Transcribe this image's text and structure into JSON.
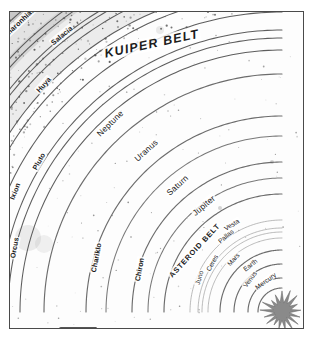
{
  "figure": {
    "kind": "solar-system-orbit-diagram",
    "style": "grayscale halftone scan",
    "frame_border_color": "#4a4a4a",
    "background_color": "#ffffff",
    "orbit_line_color": "#5a5a5a",
    "sun_color": "#8a8a8a",
    "sun_label": "Sun"
  },
  "chart_data": {
    "type": "scatter",
    "title": "KUIPER BELT",
    "xlabel": "",
    "ylabel": "",
    "grid": false,
    "legend": null,
    "note": "Concentric orbital arcs centred on the Sun at lower-right; each arc labelled with the body that follows it."
  },
  "regions": [
    {
      "id": "kuiper",
      "label": "KUIPER BELT",
      "style": "bold-italic-caps",
      "x": 143,
      "y": 42,
      "rot": -12
    },
    {
      "id": "asteroid",
      "label": "ASTEROID BELT",
      "style": "bold-caps",
      "x": 196,
      "y": 265,
      "rot": -47
    },
    {
      "id": "centaurs",
      "label": "CENTAURS",
      "style": "bold-caps-boxed",
      "x": 68,
      "y": 319,
      "rot": 0
    }
  ],
  "orbits": [
    {
      "name": "Sedna",
      "group": "detached",
      "r": 560,
      "label_t": 0.055,
      "size": "kbname"
    },
    {
      "name": "Eris",
      "group": "kuiper",
      "r": 432,
      "label_t": 0.12,
      "size": "kbname"
    },
    {
      "name": "Makemake",
      "group": "kuiper",
      "r": 408,
      "label_t": 0.19,
      "size": "kbname"
    },
    {
      "name": "Varda",
      "group": "kuiper",
      "r": 398,
      "label_t": 0.56,
      "size": "kbname"
    },
    {
      "name": "Altjira",
      "group": "kuiper",
      "r": 372,
      "label_t": 0.33,
      "size": "kbname"
    },
    {
      "name": "Teharonhiawako",
      "group": "kuiper",
      "r": 366,
      "label_t": 0.52,
      "size": "kbname"
    },
    {
      "name": "Quaoar",
      "group": "kuiper",
      "r": 352,
      "label_t": 0.27,
      "size": "kbname"
    },
    {
      "name": "Varuna",
      "group": "kuiper",
      "r": 348,
      "label_t": 0.385,
      "size": "kbname"
    },
    {
      "name": "Salacia",
      "group": "kuiper",
      "r": 340,
      "label_t": 0.56,
      "size": "kbname"
    },
    {
      "name": "Praamzius",
      "group": "kuiper",
      "r": 326,
      "label_t": 0.345,
      "size": "kbname"
    },
    {
      "name": "Huya",
      "group": "kuiper",
      "r": 318,
      "label_t": 0.47,
      "size": "kbname"
    },
    {
      "name": "Haumea",
      "group": "kuiper",
      "r": 300,
      "label_t": 0.155,
      "size": "kbname"
    },
    {
      "name": "Ixion",
      "group": "kuiper",
      "r": 282,
      "label_t": 0.245,
      "size": "kbname"
    },
    {
      "name": "Pluto",
      "group": "kuiper",
      "r": 274,
      "label_t": 0.33,
      "size": "kbname"
    },
    {
      "name": "Orcus",
      "group": "kuiper",
      "r": 262,
      "label_t": 0.115,
      "size": "kbname"
    },
    {
      "name": "Neptune",
      "group": "planet",
      "r": 238,
      "label_t": 0.505,
      "size": "planet"
    },
    {
      "name": "Uranus",
      "group": "planet",
      "r": 196,
      "label_t": 0.53,
      "size": "planet"
    },
    {
      "name": "Chariklo",
      "group": "centaur",
      "r": 176,
      "label_t": 0.12,
      "size": "kbname"
    },
    {
      "name": "Saturn",
      "group": "planet",
      "r": 150,
      "label_t": 0.53,
      "size": "planet"
    },
    {
      "name": "Chiron",
      "group": "centaur",
      "r": 134,
      "label_t": 0.115,
      "size": "kbname"
    },
    {
      "name": "Jupiter",
      "group": "planet",
      "r": 118,
      "label_t": 0.56,
      "size": "planet"
    },
    {
      "name": "Vesta",
      "group": "asteroid",
      "r": 92,
      "label_t": 0.64,
      "size": "minor"
    },
    {
      "name": "Pallas",
      "group": "asteroid",
      "r": 84,
      "label_t": 0.56,
      "size": "minor"
    },
    {
      "name": "Juno",
      "group": "asteroid",
      "r": 80,
      "label_t": 0.175,
      "size": "minor"
    },
    {
      "name": "Ceres",
      "group": "asteroid",
      "r": 74,
      "label_t": 0.32,
      "size": "minor"
    },
    {
      "name": "Mars",
      "group": "planet",
      "r": 62,
      "label_t": 0.47,
      "size": "minor"
    },
    {
      "name": "Earth",
      "group": "planet",
      "r": 48,
      "label_t": 0.57,
      "size": "minor"
    },
    {
      "name": "Venus",
      "group": "planet",
      "r": 34,
      "label_t": 0.4,
      "size": "minor"
    },
    {
      "name": "Mercury",
      "group": "planet",
      "r": 24,
      "label_t": 0.6,
      "size": "minor"
    }
  ]
}
